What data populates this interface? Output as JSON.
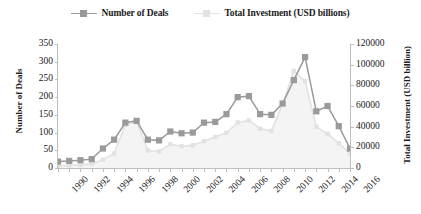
{
  "legend": {
    "position": "top-center",
    "entries": [
      {
        "label": "Number of Deals",
        "marker": "line-square-marker",
        "color": "#9a9a9a"
      },
      {
        "label": "Total Investment (USD billions)",
        "marker": "line-square-marker",
        "color": "#e2e2e2"
      }
    ]
  },
  "axes": {
    "y_left_title": "Number of Deals",
    "y_right_title": "Total Investment (USD billion)",
    "x_title": ""
  },
  "chart_data": {
    "type": "line",
    "title": "",
    "subtitle": "",
    "xlabel": "",
    "ylabel": "Number of Deals",
    "y2label": "Total Investment (USD billion)",
    "grid": false,
    "legend_position": "top-center",
    "x": [
      1990,
      1991,
      1992,
      1993,
      1994,
      1995,
      1996,
      1997,
      1998,
      1999,
      2000,
      2001,
      2002,
      2003,
      2004,
      2005,
      2006,
      2007,
      2008,
      2009,
      2010,
      2011,
      2012,
      2013,
      2014,
      2015,
      2016
    ],
    "xticklabels": [
      "1990",
      "1992",
      "1994",
      "1996",
      "1998",
      "2000",
      "2002",
      "2004",
      "2006",
      "2008",
      "2010",
      "2012",
      "2014",
      "2016"
    ],
    "xtick_values": [
      1990,
      1992,
      1994,
      1996,
      1998,
      2000,
      2002,
      2004,
      2006,
      2008,
      2010,
      2012,
      2014,
      2016
    ],
    "ylim": [
      0,
      350
    ],
    "yticks": [
      0,
      50,
      100,
      150,
      200,
      250,
      300,
      350
    ],
    "yticklabels": [
      "0",
      "50",
      "100",
      "150",
      "200",
      "250",
      "300",
      "350"
    ],
    "y2lim": [
      0,
      120000
    ],
    "y2ticks": [
      0,
      20000,
      40000,
      60000,
      80000,
      100000,
      120000
    ],
    "y2ticklabels": [
      "0",
      "20000",
      "40000",
      "60000",
      "80000",
      "100000",
      "120000"
    ],
    "series": [
      {
        "name": "Number of Deals",
        "axis": "left",
        "color": "#9a9a9a",
        "marker": "square",
        "values": [
          18,
          20,
          22,
          25,
          55,
          80,
          128,
          133,
          80,
          78,
          103,
          98,
          100,
          128,
          130,
          152,
          200,
          203,
          152,
          150,
          182,
          248,
          313,
          160,
          175,
          118,
          55
        ]
      },
      {
        "name": "Total Investment (USD billions)",
        "axis": "right",
        "color": "#e2e2e2",
        "marker": "none",
        "values": [
          2000,
          2500,
          3000,
          4000,
          8000,
          14000,
          42000,
          45000,
          17000,
          16000,
          23000,
          21000,
          22000,
          26000,
          30000,
          34000,
          44000,
          46000,
          38000,
          36000,
          62000,
          94000,
          84000,
          40000,
          33000,
          24000,
          14000
        ]
      }
    ]
  }
}
